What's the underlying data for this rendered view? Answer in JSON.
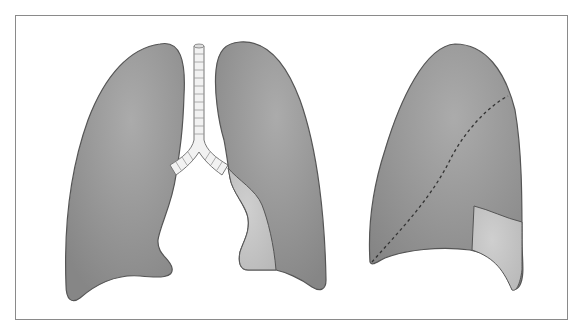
{
  "figure": {
    "panels": [
      {
        "name": "frontal-view",
        "description": "Anterior view of lungs with trachea and bronchi; shaded lighter region on left-lower aspect of right-side lung"
      },
      {
        "name": "lateral-view",
        "description": "Lateral view of lung with dashed oblique fissure and lighter shaded lower segment"
      }
    ]
  },
  "colors": {
    "lung_fill": "#8e8e8e",
    "lung_highlight": "#a8a8a8",
    "segment_fill": "#c4c4c4",
    "outline": "#555555",
    "frame": "#8a8a8a",
    "trachea_fill": "#f2f2f2"
  }
}
